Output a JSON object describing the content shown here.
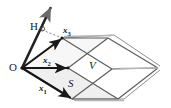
{
  "figure": {
    "background_color": "#ffffff",
    "labels": {
      "origin": "O",
      "height": "H",
      "vector1": "x",
      "vector1_sub": "1",
      "vector2": "x",
      "vector2_sub": "2",
      "vector3": "x",
      "vector3_sub": "3",
      "base_area": "S",
      "volume": "V"
    },
    "colors": {
      "stroke_dark": "#1a1a1a",
      "stroke_gray": "#8c8c8c",
      "stroke_mid": "#555555",
      "fill_shade": "#e8e8e8",
      "background": "#ffffff"
    },
    "geometry": {
      "origin_point": [
        22,
        68
      ],
      "x1_tip": [
        72,
        99
      ],
      "x2_tip": [
        68,
        68
      ],
      "x3_tip": [
        62,
        38
      ],
      "h_tip": [
        52,
        5
      ],
      "right_vertex": [
        160,
        68
      ],
      "description": "Parallelepiped spanned by vectors x1, x2, x3 from origin O; H is the perpendicular height onto the x1-x2 base plane; S denotes the base parallelogram area; V denotes the enclosed volume."
    }
  }
}
